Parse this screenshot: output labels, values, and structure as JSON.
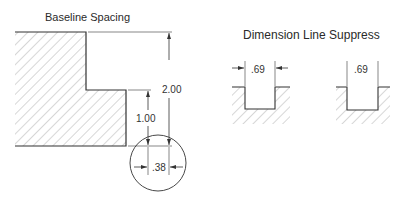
{
  "left_panel": {
    "title": "Baseline Spacing",
    "dimensions": {
      "overall_height": "2.00",
      "step_height": "1.00",
      "spacing_detail": ".38"
    }
  },
  "right_panel": {
    "title": "Dimension Line Suppress",
    "examples": [
      {
        "label": ".69",
        "dimension_line": "shown"
      },
      {
        "label": ".69",
        "dimension_line": "suppressed"
      }
    ]
  },
  "colors": {
    "line": "#333333",
    "hatch": "#9a9a9a",
    "background": "#ffffff"
  }
}
